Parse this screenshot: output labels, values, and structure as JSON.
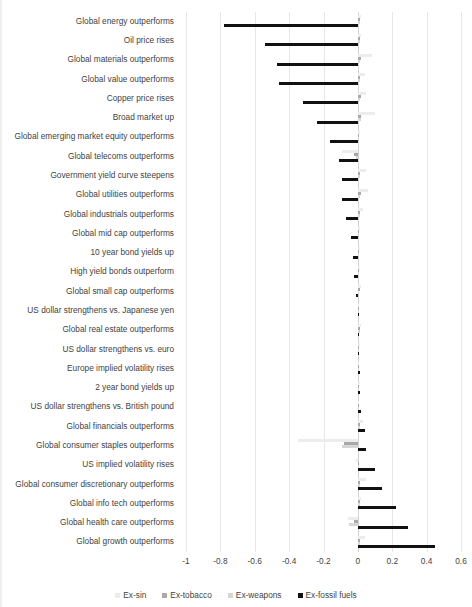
{
  "chart_data": {
    "type": "bar",
    "orientation": "horizontal",
    "title": "",
    "subtitle": "",
    "xlabel": "",
    "ylabel": "",
    "xlim": [
      -1,
      0.6
    ],
    "xticks": [
      -1,
      -0.8,
      -0.6,
      -0.4,
      -0.2,
      0,
      0.2,
      0.4,
      0.6
    ],
    "xtick_labels": [
      "-1",
      "-0.8",
      "-0.6",
      "-0.4",
      "-0.2",
      "0",
      "0.2",
      "0.4",
      "0.6"
    ],
    "grid": true,
    "grid_axis": "x",
    "legend_position": "bottom",
    "categories": [
      "Global energy outperforms",
      "Oil price rises",
      "Global materials outperforms",
      "Global value outperforms",
      "Copper price rises",
      "Broad market up",
      "Global emerging market equity outperforms",
      "Global telecoms outperforms",
      "Government yield curve steepens",
      "Global utilities outperforms",
      "Global industrials outperforms",
      "Global mid cap outperforms",
      "10 year bond yields up",
      "High yield bonds outperform",
      "Global small cap outperforms",
      "US dollar strengthens vs. Japanese yen",
      "Global real estate outperforms",
      "US dollar strengthens vs. euro",
      "Europe implied volatility rises",
      "2 year bond yields up",
      "US dollar strengthens vs. British pound",
      "Global financials outperforms",
      "Global consumer staples outperforms",
      "US implied volatility rises",
      "Global consumer discretionary outperforms",
      "Global info tech outperforms",
      "Global health care outperforms",
      "Global growth outperforms"
    ],
    "series": [
      {
        "name": "Ex-sin",
        "color": "#ececec",
        "values": [
          0.02,
          0.02,
          0.08,
          0.04,
          0.05,
          0.1,
          0.01,
          -0.09,
          0.05,
          0.06,
          0.03,
          0.01,
          0.01,
          0.01,
          0.02,
          0.0,
          0.02,
          0.01,
          0.0,
          0.01,
          0.0,
          0.03,
          -0.35,
          -0.01,
          0.05,
          0.02,
          -0.06,
          0.04
        ]
      },
      {
        "name": "Ex-tobacco",
        "color": "#a9a9a9",
        "values": [
          0.01,
          0.01,
          0.02,
          0.01,
          0.02,
          0.02,
          0.0,
          -0.02,
          0.01,
          0.02,
          0.01,
          0.0,
          0.0,
          0.0,
          0.01,
          0.0,
          0.01,
          0.0,
          0.0,
          0.0,
          0.0,
          0.01,
          -0.08,
          0.0,
          0.01,
          0.01,
          -0.02,
          0.01
        ]
      },
      {
        "name": "Ex-weapons",
        "color": "#d6d6d6",
        "values": [
          0.01,
          0.01,
          0.01,
          0.01,
          0.01,
          0.02,
          0.0,
          -0.01,
          0.01,
          0.01,
          0.01,
          0.0,
          0.0,
          0.0,
          0.0,
          0.0,
          0.01,
          0.0,
          0.0,
          0.0,
          0.0,
          0.01,
          -0.09,
          0.0,
          0.01,
          0.01,
          -0.05,
          0.01
        ]
      },
      {
        "name": "Ex-fossil fuels",
        "color": "#111111",
        "values": [
          -0.78,
          -0.54,
          -0.47,
          -0.46,
          -0.32,
          -0.24,
          -0.16,
          -0.11,
          -0.09,
          -0.09,
          -0.07,
          -0.04,
          -0.03,
          -0.02,
          -0.01,
          0.0,
          0.0,
          0.0,
          0.01,
          0.01,
          0.02,
          0.04,
          0.05,
          0.1,
          0.14,
          0.22,
          0.29,
          0.45
        ]
      }
    ]
  },
  "legend": {
    "items": [
      {
        "label": "Ex-sin",
        "color": "#ececec"
      },
      {
        "label": "Ex-tobacco",
        "color": "#a9a9a9"
      },
      {
        "label": "Ex-weapons",
        "color": "#d6d6d6"
      },
      {
        "label": "Ex-fossil fuels",
        "color": "#111111"
      }
    ]
  }
}
